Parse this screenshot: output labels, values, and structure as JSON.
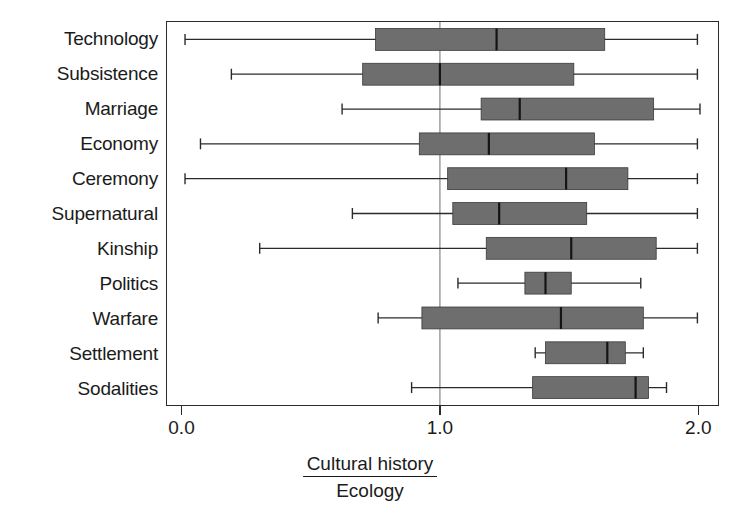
{
  "chart_data": {
    "type": "boxplot",
    "title": "",
    "xlabel_numerator": "Cultural history",
    "xlabel_denominator": "Ecology",
    "ylabel": "",
    "orientation": "horizontal",
    "xlim": [
      -0.06,
      2.08
    ],
    "xticks": [
      0.0,
      1.0,
      2.0
    ],
    "xticklabels": [
      "0.0",
      "1.0",
      "2.0"
    ],
    "grid": false,
    "reference_line": 1.0,
    "legend": "none",
    "box_fill_color": "#6e6e6e",
    "box_edge_color": "#3a3a3a",
    "median_color": "#141414",
    "whisker_color": "#2b2b2b",
    "frame_color": "#2b2b2b",
    "categories": [
      "Technology",
      "Subsistence",
      "Marriage",
      "Economy",
      "Ceremony",
      "Supernatural",
      "Kinship",
      "Politics",
      "Warfare",
      "Settlement",
      "Sodalities"
    ],
    "boxes": [
      {
        "category": "Technology",
        "whisker_low": 0.01,
        "q1": 0.75,
        "median": 1.22,
        "q3": 1.64,
        "whisker_high": 2.0
      },
      {
        "category": "Subsistence",
        "whisker_low": 0.19,
        "q1": 0.7,
        "median": 1.0,
        "q3": 1.52,
        "whisker_high": 2.0
      },
      {
        "category": "Marriage",
        "whisker_low": 0.62,
        "q1": 1.16,
        "median": 1.31,
        "q3": 1.83,
        "whisker_high": 2.01
      },
      {
        "category": "Economy",
        "whisker_low": 0.07,
        "q1": 0.92,
        "median": 1.19,
        "q3": 1.6,
        "whisker_high": 2.0
      },
      {
        "category": "Ceremony",
        "whisker_low": 0.01,
        "q1": 1.03,
        "median": 1.49,
        "q3": 1.73,
        "whisker_high": 2.0
      },
      {
        "category": "Supernatural",
        "whisker_low": 0.66,
        "q1": 1.05,
        "median": 1.23,
        "q3": 1.57,
        "whisker_high": 2.0
      },
      {
        "category": "Kinship",
        "whisker_low": 0.3,
        "q1": 1.18,
        "median": 1.51,
        "q3": 1.84,
        "whisker_high": 2.0
      },
      {
        "category": "Politics",
        "whisker_low": 1.07,
        "q1": 1.33,
        "median": 1.41,
        "q3": 1.51,
        "whisker_high": 1.78
      },
      {
        "category": "Warfare",
        "whisker_low": 0.76,
        "q1": 0.93,
        "median": 1.47,
        "q3": 1.79,
        "whisker_high": 2.0
      },
      {
        "category": "Settlement",
        "whisker_low": 1.37,
        "q1": 1.41,
        "median": 1.65,
        "q3": 1.72,
        "whisker_high": 1.79
      },
      {
        "category": "Sodalities",
        "whisker_low": 0.89,
        "q1": 1.36,
        "median": 1.76,
        "q3": 1.81,
        "whisker_high": 1.88
      }
    ]
  }
}
